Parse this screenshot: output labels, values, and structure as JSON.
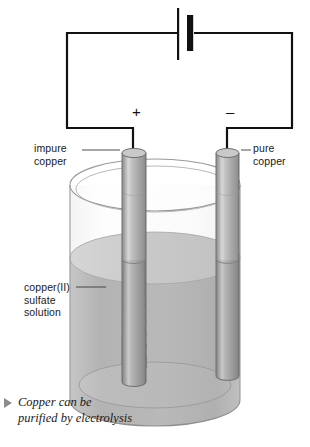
{
  "figure": {
    "caption": "Copper can be purified by electrolysis",
    "caption_bullet": "triangle-right-marker"
  },
  "circuit": {
    "battery_symbol": "battery-cell",
    "positive_terminal_sign": "+",
    "negative_terminal_sign": "–",
    "wire_color": "#111111"
  },
  "labels": {
    "anode": "impure\ncopper",
    "cathode": "pure\ncopper",
    "electrolyte": "copper(II)\nsulfate\nsolution"
  },
  "apparatus": {
    "beaker": "glass-beaker",
    "anode_rod": "impure-copper-electrode",
    "cathode_rod": "pure-copper-electrode",
    "solution": "copper-sulfate-solution"
  },
  "colors": {
    "wire": "#111111",
    "solution": "#b6b6b6",
    "solution_surface": "#cfcfcf",
    "glass_outline": "#9a9a9a",
    "rod_body": "#a8a8a8",
    "rod_highlight": "#e2e2e2",
    "rod_edge": "#6f6f6f",
    "text": "#1a1a1a",
    "bullet": "#8c8c8c"
  }
}
